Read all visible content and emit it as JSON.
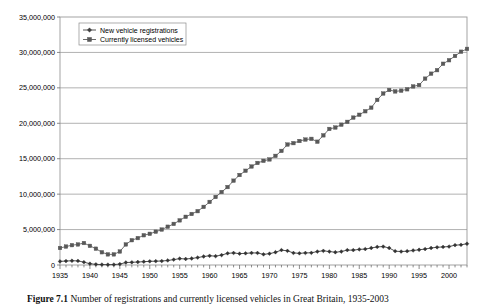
{
  "figure": {
    "caption_label": "Figure 7.1",
    "caption_text": "Number of registrations and currently licensed vehicles in Great Britain, 1935-2003"
  },
  "legend": {
    "position": "top-left-inside",
    "bordered": true,
    "entries": [
      {
        "label": "New vehicle registrations",
        "marker": "diamond-marker-icon",
        "color": "#404040"
      },
      {
        "label": "Currently licensed vehicles",
        "marker": "square-marker-icon",
        "color": "#595959"
      }
    ]
  },
  "axes": {
    "y_tick_labels": [
      "35,000,000",
      "30,000,000",
      "25,000,000",
      "20,000,000",
      "15,000,000",
      "10,000,000",
      "5,000,000",
      "0"
    ],
    "x_tick_labels": [
      "1935",
      "1940",
      "1945",
      "1950",
      "1955",
      "1960",
      "1965",
      "1970",
      "1975",
      "1980",
      "1985",
      "1990",
      "1995",
      "2000"
    ]
  },
  "chart_data": {
    "type": "line",
    "title": "",
    "subtitle": "",
    "xlabel": "",
    "ylabel": "",
    "xlim": [
      1935,
      2003
    ],
    "ylim": [
      0,
      35000000
    ],
    "ytick_step": 5000000,
    "xtick_step": 5,
    "grid": "horizontal",
    "legend_position": "upper left inside plot",
    "x": [
      1935,
      1936,
      1937,
      1938,
      1939,
      1940,
      1941,
      1942,
      1943,
      1944,
      1945,
      1946,
      1947,
      1948,
      1949,
      1950,
      1951,
      1952,
      1953,
      1954,
      1955,
      1956,
      1957,
      1958,
      1959,
      1960,
      1961,
      1962,
      1963,
      1964,
      1965,
      1966,
      1967,
      1968,
      1969,
      1970,
      1971,
      1972,
      1973,
      1974,
      1975,
      1976,
      1977,
      1978,
      1979,
      1980,
      1981,
      1982,
      1983,
      1984,
      1985,
      1986,
      1987,
      1988,
      1989,
      1990,
      1991,
      1992,
      1993,
      1994,
      1995,
      1996,
      1997,
      1998,
      1999,
      2000,
      2001,
      2002,
      2003
    ],
    "series": [
      {
        "name": "New vehicle registrations",
        "marker": "diamond",
        "color": "#333333",
        "values": [
          510000,
          560000,
          600000,
          580000,
          400000,
          180000,
          90000,
          60000,
          50000,
          60000,
          130000,
          350000,
          380000,
          420000,
          470000,
          520000,
          540000,
          560000,
          640000,
          760000,
          900000,
          850000,
          920000,
          1050000,
          1200000,
          1300000,
          1250000,
          1400000,
          1650000,
          1700000,
          1600000,
          1650000,
          1700000,
          1700000,
          1500000,
          1600000,
          1800000,
          2100000,
          2000000,
          1700000,
          1650000,
          1700000,
          1720000,
          1900000,
          2000000,
          1900000,
          1800000,
          1900000,
          2100000,
          2100000,
          2200000,
          2250000,
          2400000,
          2550000,
          2600000,
          2400000,
          1950000,
          1900000,
          1950000,
          2050000,
          2150000,
          2250000,
          2400000,
          2500000,
          2550000,
          2600000,
          2800000,
          2850000,
          3000000
        ]
      },
      {
        "name": "Currently licensed vehicles",
        "marker": "square",
        "color": "#595959",
        "values": [
          2400000,
          2600000,
          2800000,
          2900000,
          3100000,
          2700000,
          2300000,
          1800000,
          1500000,
          1500000,
          1900000,
          2900000,
          3500000,
          3800000,
          4200000,
          4400000,
          4700000,
          5000000,
          5400000,
          5800000,
          6300000,
          6800000,
          7200000,
          7600000,
          8200000,
          8900000,
          9600000,
          10300000,
          11000000,
          11900000,
          12700000,
          13300000,
          13900000,
          14400000,
          14700000,
          14900000,
          15400000,
          16100000,
          17000000,
          17200000,
          17500000,
          17700000,
          17800000,
          17400000,
          18300000,
          19200000,
          19400000,
          19800000,
          20200000,
          20800000,
          21200000,
          21700000,
          22200000,
          23300000,
          24200000,
          24700000,
          24500000,
          24600000,
          24800000,
          25200000,
          25400000,
          26300000,
          27000000,
          27500000,
          28400000,
          28900000,
          29500000,
          30100000,
          30500000
        ]
      }
    ]
  }
}
